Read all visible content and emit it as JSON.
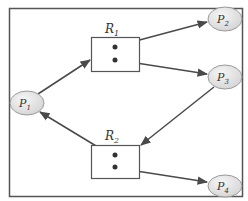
{
  "diagram": {
    "type": "resource-allocation-graph",
    "colors": {
      "frame": "#555555",
      "edge": "#4a4a4a",
      "process_fill": "#e6e6e6",
      "process_stroke": "#9a9a9a",
      "resource_stroke": "#555555"
    },
    "processes": [
      {
        "id": "P1",
        "label": "P",
        "sub": "1"
      },
      {
        "id": "P2",
        "label": "P",
        "sub": "2"
      },
      {
        "id": "P3",
        "label": "P",
        "sub": "3"
      },
      {
        "id": "P4",
        "label": "P",
        "sub": "4"
      }
    ],
    "resources": [
      {
        "id": "R1",
        "label": "R",
        "sub": "1",
        "instances": 2
      },
      {
        "id": "R2",
        "label": "R",
        "sub": "2",
        "instances": 2
      }
    ],
    "edges": [
      {
        "from": "P1",
        "to": "R1",
        "kind": "request"
      },
      {
        "from": "R1",
        "to": "P2",
        "kind": "assignment"
      },
      {
        "from": "R1",
        "to": "P3",
        "kind": "assignment"
      },
      {
        "from": "P3",
        "to": "R2",
        "kind": "request"
      },
      {
        "from": "R2",
        "to": "P1",
        "kind": "assignment"
      },
      {
        "from": "R2",
        "to": "P4",
        "kind": "assignment"
      }
    ]
  }
}
